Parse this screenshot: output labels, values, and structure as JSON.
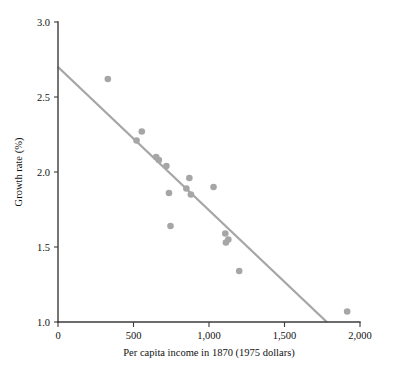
{
  "chart_data": {
    "type": "scatter",
    "title": "",
    "xlabel": "Per capita income in 1870 (1975 dollars)",
    "ylabel": "Growth rate (%)",
    "xlim": [
      0,
      2000
    ],
    "ylim": [
      1.0,
      3.0
    ],
    "xticks": [
      0,
      500,
      1000,
      1500,
      2000
    ],
    "xtick_labels": [
      "0",
      "500",
      "1,000",
      "1,500",
      "2,000"
    ],
    "yticks": [
      1.0,
      1.5,
      2.0,
      2.5,
      3.0
    ],
    "ytick_labels": [
      "1.0",
      "1.5",
      "2.0",
      "2.5",
      "3.0"
    ],
    "grid": false,
    "legend": "none",
    "point_color": "#a6a6a6",
    "line_color": "#a6a6a6",
    "axis_color": "#3b3b3b",
    "points": [
      {
        "x": 330,
        "y": 2.62
      },
      {
        "x": 520,
        "y": 2.21
      },
      {
        "x": 555,
        "y": 2.27
      },
      {
        "x": 650,
        "y": 2.1
      },
      {
        "x": 668,
        "y": 2.08
      },
      {
        "x": 718,
        "y": 2.04
      },
      {
        "x": 735,
        "y": 1.86
      },
      {
        "x": 745,
        "y": 1.64
      },
      {
        "x": 850,
        "y": 1.89
      },
      {
        "x": 870,
        "y": 1.96
      },
      {
        "x": 880,
        "y": 1.85
      },
      {
        "x": 1030,
        "y": 1.9
      },
      {
        "x": 1108,
        "y": 1.59
      },
      {
        "x": 1112,
        "y": 1.53
      },
      {
        "x": 1128,
        "y": 1.55
      },
      {
        "x": 1200,
        "y": 1.34
      },
      {
        "x": 1915,
        "y": 1.07
      }
    ],
    "trend_line": {
      "x0": 0,
      "y0": 2.7,
      "x1": 1780,
      "y1": 1.0
    }
  }
}
